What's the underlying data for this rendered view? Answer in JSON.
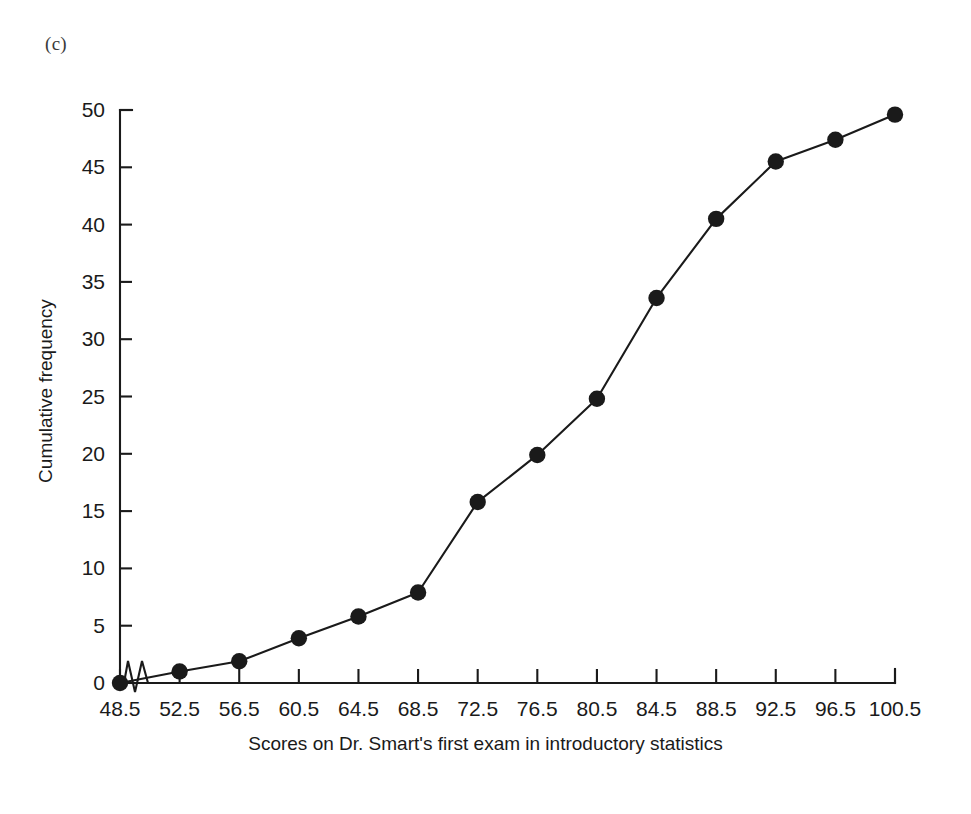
{
  "figure": {
    "panel_label": "(c)",
    "background_color": "#ffffff",
    "ink_color": "#1a1a1a"
  },
  "chart_data": {
    "type": "line",
    "title": "",
    "subtitle": "",
    "xlabel": "Scores on Dr. Smart's first exam in introductory statistics",
    "ylabel": "Cumulative frequency",
    "x": [
      48.5,
      52.5,
      56.5,
      60.5,
      64.5,
      68.5,
      72.5,
      76.5,
      80.5,
      84.5,
      88.5,
      92.5,
      96.5,
      100.5
    ],
    "values": [
      0,
      1,
      1.9,
      3.9,
      5.8,
      7.9,
      15.8,
      19.9,
      24.8,
      33.6,
      40.5,
      45.5,
      47.4,
      49.6
    ],
    "xtick_labels": [
      "48.5",
      "52.5",
      "56.5",
      "60.5",
      "64.5",
      "68.5",
      "72.5",
      "76.5",
      "80.5",
      "84.5",
      "88.5",
      "92.5",
      "96.5",
      "100.5"
    ],
    "ytick_labels": [
      "0",
      "5",
      "10",
      "15",
      "20",
      "25",
      "30",
      "35",
      "40",
      "45",
      "50"
    ],
    "yticks": [
      0,
      5,
      10,
      15,
      20,
      25,
      30,
      35,
      40,
      45,
      50
    ],
    "xlim": [
      48.5,
      100.5
    ],
    "ylim": [
      0,
      50
    ],
    "grid": false,
    "legend": null,
    "marker": "filled-circle",
    "axis_break": {
      "axis": "x",
      "symbol": "zigzag",
      "note": "broken x-axis between origin and first data point"
    }
  }
}
